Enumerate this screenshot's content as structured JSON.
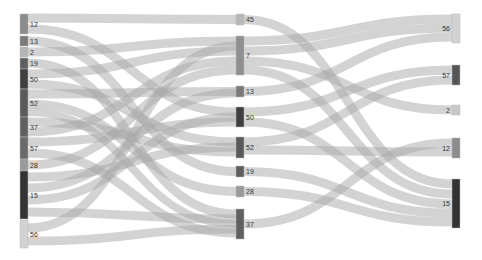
{
  "chart_data": {
    "type": "sankey",
    "title": "",
    "columns": [
      {
        "name": "left",
        "x": 20,
        "nodes": [
          {
            "id": "L12",
            "label": "12",
            "y0": 14,
            "y1": 34,
            "color": "#8c8c8c"
          },
          {
            "id": "L13",
            "label": "13",
            "y0": 36,
            "y1": 46,
            "color": "#7a7a7a"
          },
          {
            "id": "L2",
            "label": "2",
            "y0": 47,
            "y1": 57,
            "color": "#b5b5b5"
          },
          {
            "id": "L19",
            "label": "19",
            "y0": 58,
            "y1": 69,
            "color": "#5e5e5e"
          },
          {
            "id": "L50",
            "label": "50",
            "y0": 69,
            "y1": 89,
            "color": "#3f3f3f"
          },
          {
            "id": "L52",
            "label": "52",
            "y0": 89,
            "y1": 117,
            "color": "#5a5a5a"
          },
          {
            "id": "L37",
            "label": "37",
            "y0": 117,
            "y1": 137,
            "color": "#606060"
          },
          {
            "id": "L57",
            "label": "57",
            "y0": 137,
            "y1": 159,
            "color": "#6a6a6a"
          },
          {
            "id": "L28",
            "label": "28",
            "y0": 159,
            "y1": 171,
            "color": "#9a9a9a"
          },
          {
            "id": "L15",
            "label": "15",
            "y0": 171,
            "y1": 219,
            "color": "#333333"
          },
          {
            "id": "L56",
            "label": "56",
            "y0": 220,
            "y1": 248,
            "color": "#d2d2d2"
          }
        ]
      },
      {
        "name": "middle",
        "x": 236,
        "nodes": [
          {
            "id": "M45",
            "label": "45",
            "y0": 14,
            "y1": 25,
            "color": "#b8b8b8"
          },
          {
            "id": "M7",
            "label": "7",
            "y0": 36,
            "y1": 75,
            "color": "#8f8f8f"
          },
          {
            "id": "M13",
            "label": "13",
            "y0": 86,
            "y1": 97,
            "color": "#7a7a7a"
          },
          {
            "id": "M50",
            "label": "50",
            "y0": 107,
            "y1": 127,
            "color": "#3f3f3f"
          },
          {
            "id": "M52",
            "label": "52",
            "y0": 137,
            "y1": 158,
            "color": "#5a5a5a"
          },
          {
            "id": "M19",
            "label": "19",
            "y0": 166,
            "y1": 177,
            "color": "#5e5e5e"
          },
          {
            "id": "M28",
            "label": "28",
            "y0": 186,
            "y1": 197,
            "color": "#9a9a9a"
          },
          {
            "id": "M37",
            "label": "37",
            "y0": 209,
            "y1": 239,
            "color": "#606060"
          }
        ]
      },
      {
        "name": "right",
        "x": 452,
        "nodes": [
          {
            "id": "R56",
            "label": "56",
            "y0": 14,
            "y1": 43,
            "color": "#d2d2d2"
          },
          {
            "id": "R57",
            "label": "57",
            "y0": 65,
            "y1": 85,
            "color": "#555555"
          },
          {
            "id": "R2",
            "label": "2",
            "y0": 105,
            "y1": 115,
            "color": "#c8c8c8"
          },
          {
            "id": "R12",
            "label": "12",
            "y0": 138,
            "y1": 158,
            "color": "#8c8c8c"
          },
          {
            "id": "R15",
            "label": "15",
            "y0": 179,
            "y1": 228,
            "color": "#333333"
          }
        ]
      }
    ],
    "links": [
      {
        "from": "L12",
        "y_from": 18,
        "to": "M45",
        "y_to": 19.5,
        "width": 9
      },
      {
        "from": "L12",
        "y_from": 29,
        "to": "M50",
        "y_to": 112,
        "width": 9
      },
      {
        "from": "L13",
        "y_from": 41,
        "to": "M19",
        "y_to": 171.5,
        "width": 9
      },
      {
        "from": "L2",
        "y_from": 52,
        "to": "M7",
        "y_to": 41,
        "width": 9
      },
      {
        "from": "L19",
        "y_from": 63,
        "to": "M37",
        "y_to": 214,
        "width": 9
      },
      {
        "from": "L50",
        "y_from": 74,
        "to": "M7",
        "y_to": 51,
        "width": 9
      },
      {
        "from": "L50",
        "y_from": 84,
        "to": "M52",
        "y_to": 142,
        "width": 9
      },
      {
        "from": "L52",
        "y_from": 94,
        "to": "M13",
        "y_to": 91.5,
        "width": 9
      },
      {
        "from": "L52",
        "y_from": 104,
        "to": "M28",
        "y_to": 191.5,
        "width": 9
      },
      {
        "from": "L52",
        "y_from": 112,
        "to": "M37",
        "y_to": 224,
        "width": 8
      },
      {
        "from": "L37",
        "y_from": 122,
        "to": "M52",
        "y_to": 152,
        "width": 9
      },
      {
        "from": "L37",
        "y_from": 132,
        "to": "M7",
        "y_to": 61,
        "width": 9
      },
      {
        "from": "L57",
        "y_from": 142,
        "to": "M50",
        "y_to": 122,
        "width": 9
      },
      {
        "from": "L57",
        "y_from": 153,
        "to": "M37",
        "y_to": 233,
        "width": 9
      },
      {
        "from": "L28",
        "y_from": 165,
        "to": "M7",
        "y_to": 70,
        "width": 9
      },
      {
        "from": "L15",
        "y_from": 177,
        "to": "M52",
        "y_to": 147,
        "width": 9
      },
      {
        "from": "L15",
        "y_from": 188,
        "to": "M13",
        "y_to": 93,
        "width": 9
      },
      {
        "from": "L15",
        "y_from": 200,
        "to": "M50",
        "y_to": 117,
        "width": 9
      },
      {
        "from": "L15",
        "y_from": 212,
        "to": "M37",
        "y_to": 219,
        "width": 9
      },
      {
        "from": "L56",
        "y_from": 228,
        "to": "M7",
        "y_to": 46,
        "width": 9
      },
      {
        "from": "L56",
        "y_from": 241,
        "to": "M37",
        "y_to": 229,
        "width": 9
      },
      {
        "from": "M45",
        "y_from": 19.5,
        "to": "R15",
        "y_to": 184,
        "width": 9
      },
      {
        "from": "M7",
        "y_from": 41,
        "to": "R56",
        "y_to": 19,
        "width": 9
      },
      {
        "from": "M7",
        "y_from": 51,
        "to": "R56",
        "y_to": 28,
        "width": 9
      },
      {
        "from": "M7",
        "y_from": 61,
        "to": "R2",
        "y_to": 110,
        "width": 9
      },
      {
        "from": "M7",
        "y_from": 70,
        "to": "R15",
        "y_to": 194,
        "width": 9
      },
      {
        "from": "M13",
        "y_from": 91.5,
        "to": "R56",
        "y_to": 37,
        "width": 9
      },
      {
        "from": "M50",
        "y_from": 112,
        "to": "R57",
        "y_to": 70,
        "width": 9
      },
      {
        "from": "M50",
        "y_from": 122,
        "to": "R15",
        "y_to": 204,
        "width": 9
      },
      {
        "from": "M52",
        "y_from": 142,
        "to": "R57",
        "y_to": 80,
        "width": 9
      },
      {
        "from": "M52",
        "y_from": 150,
        "to": "R12",
        "y_to": 152,
        "width": 9
      },
      {
        "from": "M19",
        "y_from": 171.5,
        "to": "R15",
        "y_to": 213,
        "width": 9
      },
      {
        "from": "M28",
        "y_from": 191.5,
        "to": "R15",
        "y_to": 222,
        "width": 9
      },
      {
        "from": "M37",
        "y_from": 224,
        "to": "R12",
        "y_to": 143,
        "width": 9
      }
    ],
    "link_color": "#a8a8a8",
    "node_width": 8
  }
}
